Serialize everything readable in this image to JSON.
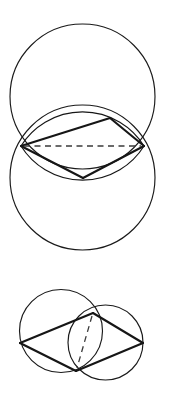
{
  "document": {
    "title": "Two geometric constructions with intersecting circles",
    "background_color": "#ffffff",
    "stroke_color": "#1a1a1a",
    "dash_color": "#3a3a3a",
    "width": 171,
    "height": 395
  },
  "figures": [
    {
      "id": "upper-figure",
      "name": "vesica-piscis-with-inscribed-rhombus",
      "description": "Two equal circles of the same radius stacked vertically, overlapping so that each passes near the other's centre; an elongated rhombus is inscribed in the lens-shaped intersection with a dashed horizontal diagonal joining the two circle intersection points.",
      "circles": [
        {
          "name": "upper-circle",
          "cx": 82.5,
          "cy": 96.5,
          "r": 72.5,
          "stroke_width": 1.15
        },
        {
          "name": "lower-circle",
          "cx": 82.5,
          "cy": 177.5,
          "r": 72.5,
          "stroke_width": 1.15
        }
      ],
      "vertices": {
        "left_intersection": {
          "name": "left-intersection-point",
          "x": 21,
          "y": 146
        },
        "right_intersection": {
          "name": "right-intersection-point",
          "x": 144,
          "y": 146
        },
        "upper_vertex": {
          "name": "upper-rhombus-vertex",
          "x": 110,
          "y": 118
        },
        "lower_vertex": {
          "name": "lower-rhombus-vertex",
          "x": 83,
          "y": 178
        }
      },
      "solid_edges": [
        {
          "name": "edge-left-to-upper-vertex",
          "from": [
            21,
            146
          ],
          "to": [
            110,
            118
          ],
          "weight": "heavy"
        },
        {
          "name": "edge-upper-vertex-to-right",
          "from": [
            110,
            118
          ],
          "to": [
            144,
            146
          ],
          "weight": "heavy"
        },
        {
          "name": "edge-right-to-lower-vertex",
          "from": [
            144,
            146
          ],
          "to": [
            83,
            178
          ],
          "weight": "heavy"
        },
        {
          "name": "edge-lower-vertex-to-left",
          "from": [
            83,
            178
          ],
          "to": [
            21,
            146
          ],
          "weight": "heavy"
        }
      ],
      "dashed_edges": [
        {
          "name": "dashed-horizontal-diagonal",
          "from": [
            24,
            146
          ],
          "to": [
            141,
            146
          ]
        }
      ],
      "lens_arcs": [
        {
          "name": "lens-upper-arc",
          "from": [
            21,
            146
          ],
          "to": [
            144,
            146
          ],
          "bulge": "up"
        },
        {
          "name": "lens-lower-arc",
          "from": [
            21,
            146
          ],
          "to": [
            144,
            146
          ],
          "bulge": "down"
        }
      ]
    },
    {
      "id": "lower-figure",
      "name": "two-unequal-circles-with-inscribed-quadrilateral",
      "description": "A larger circle on the left overlapping a smaller circle on the right; a quadrilateral is drawn through the left extreme point, the upper intersection of the two circles, the right extreme point of the small circle, and the lower intersection of the two circles, with a dashed chord joining the two intersection points.",
      "circles": [
        {
          "name": "large-left-circle",
          "cx": 61,
          "cy": 331,
          "r": 41.5,
          "stroke_width": 1.15
        },
        {
          "name": "small-right-circle",
          "cx": 105.5,
          "cy": 342.5,
          "r": 37.5,
          "stroke_width": 1.15
        }
      ],
      "vertices": {
        "left_point": {
          "name": "left-extreme-point",
          "x": 20,
          "y": 343
        },
        "upper_intersection": {
          "name": "upper-intersection-point",
          "x": 93,
          "y": 313
        },
        "right_point": {
          "name": "right-extreme-point",
          "x": 143,
          "y": 343
        },
        "lower_intersection": {
          "name": "lower-intersection-point",
          "x": 76,
          "y": 371
        }
      },
      "solid_edges": [
        {
          "name": "edge-left-to-upper-intersection",
          "from": [
            20,
            343
          ],
          "to": [
            93,
            313
          ],
          "weight": "heavy"
        },
        {
          "name": "edge-upper-intersection-to-right",
          "from": [
            93,
            313
          ],
          "to": [
            143,
            343
          ],
          "weight": "heavy"
        },
        {
          "name": "edge-right-to-lower-intersection",
          "from": [
            143,
            343
          ],
          "to": [
            76,
            371
          ],
          "weight": "heavy"
        },
        {
          "name": "edge-lower-intersection-to-left",
          "from": [
            76,
            371
          ],
          "to": [
            20,
            343
          ],
          "weight": "heavy"
        }
      ],
      "dashed_edges": [
        {
          "name": "dashed-radical-axis-chord",
          "from": [
            92,
            316
          ],
          "to": [
            77,
            368
          ]
        }
      ]
    }
  ]
}
